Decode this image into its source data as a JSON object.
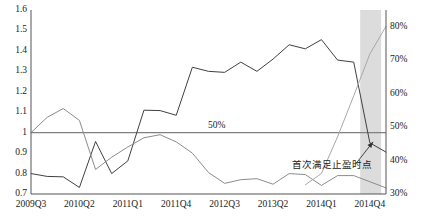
{
  "chart_data": {
    "type": "line",
    "title": "",
    "xlabel": "",
    "ylabel": "",
    "y2label": "",
    "grid": false,
    "legend": "none",
    "x_tick_labels": [
      "2009Q3",
      "2010Q2",
      "2011Q1",
      "2011Q4",
      "2012Q3",
      "2013Q2",
      "2014Q1",
      "2014Q4"
    ],
    "x_tick_indices": [
      0,
      3,
      6,
      9,
      12,
      15,
      18,
      21
    ],
    "x_count": 23,
    "ylim": [
      0.7,
      1.6
    ],
    "y_tick_labels": [
      "1.6",
      "1.5",
      "1.4",
      "1.3",
      "1.2",
      "1.1",
      "1",
      "0.9",
      "0.8",
      "0.7"
    ],
    "y_tick_values": [
      1.6,
      1.5,
      1.4,
      1.3,
      1.2,
      1.1,
      1.0,
      0.9,
      0.8,
      0.7
    ],
    "y2lim": [
      30,
      85
    ],
    "y2_tick_labels": [
      "80%",
      "70%",
      "60%",
      "50%",
      "40%",
      "30%"
    ],
    "y2_tick_values": [
      80,
      70,
      60,
      50,
      40,
      30
    ],
    "reference_line": {
      "label": "50%",
      "value": 1.0,
      "color": "#808080"
    },
    "shaded_band": {
      "start_index": 20.4,
      "end_index": 21.7,
      "color": "#d0d0d0"
    },
    "annotation": {
      "text": "首次满足止盈时点",
      "arrow_from_index": 20.1,
      "arrow_from_value": 0.845,
      "arrow_to_index": 21.2,
      "arrow_to_value": 0.955
    },
    "series": [
      {
        "name": "dark-line",
        "color": "#404040",
        "width": 1.0,
        "values": [
          0.8,
          0.786,
          0.784,
          0.732,
          0.957,
          0.8,
          0.862,
          1.11,
          1.108,
          1.085,
          1.32,
          1.3,
          1.295,
          1.345,
          1.3,
          1.36,
          1.43,
          1.41,
          1.455,
          1.355,
          1.345,
          0.95,
          0.905
        ]
      },
      {
        "name": "mid-gray-line",
        "color": "#8c8c8c",
        "width": 1.0,
        "values": [
          1.0,
          1.075,
          1.118,
          1.06,
          0.82,
          0.88,
          0.93,
          0.975,
          0.99,
          0.955,
          0.9,
          0.805,
          0.752,
          0.77,
          0.775,
          0.748,
          0.8,
          0.795,
          0.742,
          0.79,
          0.79,
          0.76,
          0.73
        ]
      },
      {
        "name": "light-gray-rising-line",
        "color": "#a8a8a8",
        "width": 1.0,
        "values": [
          null,
          null,
          null,
          null,
          null,
          null,
          null,
          null,
          null,
          null,
          null,
          null,
          null,
          null,
          null,
          null,
          null,
          0.745,
          0.8,
          0.98,
          1.18,
          1.385,
          1.52
        ]
      }
    ]
  }
}
